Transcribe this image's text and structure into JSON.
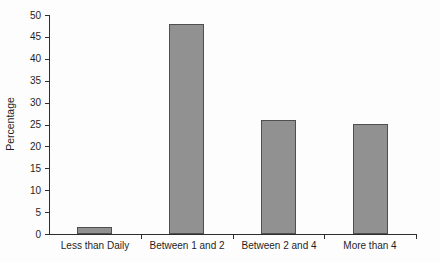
{
  "chart_data": {
    "type": "bar",
    "title": "",
    "xlabel": "",
    "ylabel": "Percentage",
    "categories": [
      "Less than Daily",
      "Between 1 and 2",
      "Between 2 and 4",
      "More than 4"
    ],
    "values": [
      1.5,
      48,
      26,
      25
    ],
    "ylim": [
      0,
      50
    ],
    "ytick_step": 5,
    "yticks": [
      0,
      5,
      10,
      15,
      20,
      25,
      30,
      35,
      40,
      45,
      50
    ],
    "grid": false,
    "legend": null,
    "bar_color": "#919191",
    "bar_border_color": "#4f4f4f",
    "axis_color": "#2e2e2e",
    "background": "#fdfdfd"
  }
}
